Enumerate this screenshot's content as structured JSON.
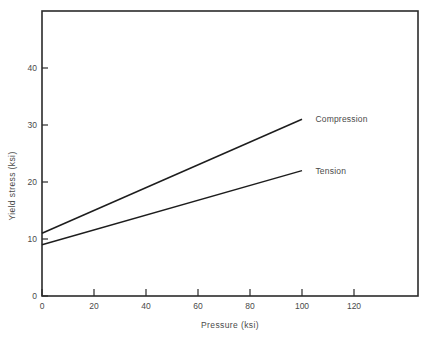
{
  "chart_data": {
    "type": "line",
    "title": "",
    "xlabel": "Pressure  (ksi)",
    "ylabel": "Yield stress  (ksi)",
    "xlim": [
      0,
      135
    ],
    "ylim": [
      0,
      50
    ],
    "xticks": [
      0,
      20,
      40,
      60,
      80,
      100,
      120
    ],
    "xticklabels": [
      "0",
      "20",
      "40",
      "60",
      "80",
      "100",
      "120"
    ],
    "yticks": [
      0,
      10,
      20,
      30,
      40
    ],
    "yticklabels": [
      "0",
      "10",
      "20",
      "30",
      "40"
    ],
    "grid": false,
    "legend_position": "inline-right-of-line-ends",
    "series": [
      {
        "name": "Compression",
        "label": "Compression",
        "color": "#1d1d1d",
        "x": [
          0,
          100
        ],
        "y": [
          11,
          31
        ],
        "label_x": 104,
        "label_y": 31
      },
      {
        "name": "Tension",
        "label": "Tension",
        "color": "#1d1d1d",
        "x": [
          0,
          100
        ],
        "y": [
          9,
          22
        ],
        "label_x": 104,
        "label_y": 22
      }
    ]
  },
  "figure": {
    "frame_name": "plot-border",
    "background": "#ffffff",
    "axis_color": "#2b2b2b"
  }
}
